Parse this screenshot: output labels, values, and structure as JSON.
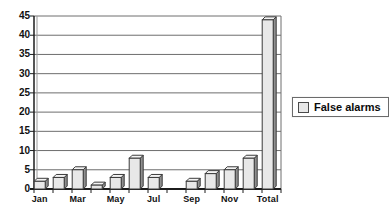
{
  "chart": {
    "legend": {
      "label": "False alarms"
    },
    "colors": {
      "background": "#ffffff",
      "bar_fill": "#e8e8e8",
      "bar_top": "#f4f4f4",
      "bar_side": "#8f8f8f",
      "bar_border": "#3b3b3b",
      "gridline": "#6e6e6e",
      "axis": "#1c1c1c",
      "wall_line": "#9a9a9a",
      "text": "#111111"
    }
  },
  "chart_data": {
    "type": "bar",
    "title": "",
    "xlabel": "",
    "ylabel": "",
    "categories": [
      "Jan",
      "Feb",
      "Mar",
      "Apr",
      "May",
      "Jun",
      "Jul",
      "Aug",
      "Sep",
      "Oct",
      "Nov",
      "Dec",
      "Total"
    ],
    "values": [
      2,
      3,
      5,
      1,
      3,
      8,
      3,
      0,
      2,
      4,
      5,
      8,
      44
    ],
    "series": [
      {
        "name": "False alarms",
        "values": [
          2,
          3,
          5,
          1,
          3,
          8,
          3,
          0,
          2,
          4,
          5,
          8,
          44
        ]
      }
    ],
    "x_tick_labels_shown": [
      "Jan",
      "Mar",
      "May",
      "Jul",
      "Sep",
      "Nov",
      "Total"
    ],
    "ylim": [
      0,
      45
    ],
    "y_ticks": [
      0,
      5,
      10,
      15,
      20,
      25,
      30,
      35,
      40,
      45
    ],
    "grid": "horizontal",
    "legend_position": "right",
    "bar_style": "3d-bevel"
  }
}
